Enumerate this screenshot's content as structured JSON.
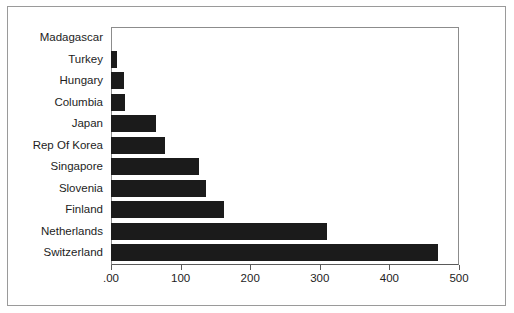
{
  "chart_data": {
    "type": "bar",
    "orientation": "horizontal",
    "title": "",
    "xlabel": "",
    "ylabel": "",
    "xlim": [
      0,
      500
    ],
    "grid": false,
    "legend": null,
    "bar_color": "#1b1b1b",
    "categories": [
      "Madagascar",
      "Turkey",
      "Hungary",
      "Columbia",
      "Japan",
      "Rep Of Korea",
      "Singapore",
      "Slovenia",
      "Finland",
      "Netherlands",
      "Switzerland"
    ],
    "values": [
      0,
      9,
      19,
      20,
      64,
      77,
      126,
      136,
      163,
      310,
      470
    ],
    "xticks": [
      0,
      100,
      200,
      300,
      400,
      500
    ],
    "xtick_labels": [
      ".00",
      "100",
      "200",
      "300",
      "400",
      "500"
    ]
  }
}
